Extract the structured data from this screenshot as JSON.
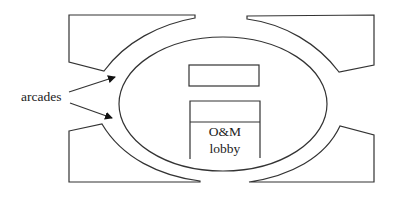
{
  "diagram": {
    "arcades_label": "arcades",
    "lobby_label_line1": "O&M",
    "lobby_label_line2": "lobby",
    "stroke_color": "#333333",
    "background": "#ffffff"
  }
}
